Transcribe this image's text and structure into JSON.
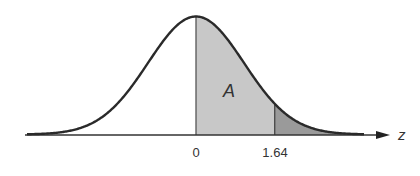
{
  "figure": {
    "type": "normal-distribution-shaded-area",
    "area_label": "A",
    "axis_label": "z",
    "ticks": [
      {
        "value": 0,
        "label": "0"
      },
      {
        "value": 1.64,
        "label": "1.64"
      }
    ],
    "shaded_regions": [
      {
        "name": "area-A",
        "from": 0,
        "to": 1.64,
        "color": "#c8c8c8"
      },
      {
        "name": "upper-tail",
        "from": 1.64,
        "to": "inf",
        "color": "#9a9a9a"
      }
    ],
    "colors": {
      "curve": "#2a2a2a",
      "axis": "#333333",
      "area_fill": "#c8c8c8",
      "tail_fill": "#9a9a9a",
      "background": "#ffffff"
    }
  }
}
